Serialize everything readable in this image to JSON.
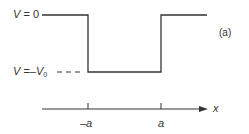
{
  "diagram": {
    "type": "finite square potential well",
    "panel_label": "(a)",
    "labels": {
      "top_level": {
        "var": "V",
        "eq": " = ",
        "value": "0"
      },
      "well_level": {
        "var": "V",
        "eq": " =–",
        "value_var": "V",
        "value_sub": "0"
      },
      "axis": "x",
      "ticks": [
        "–a",
        "a"
      ]
    },
    "levels": {
      "V_outside": "0",
      "V_inside": "-V0"
    },
    "boundaries": [
      "-a",
      "a"
    ],
    "colors": {
      "line": "#333333",
      "text": "#333333",
      "background": "#ffffff"
    }
  }
}
